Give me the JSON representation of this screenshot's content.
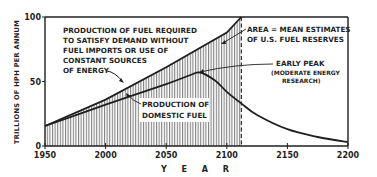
{
  "chart_data": {
    "type": "line",
    "title": "",
    "xlabel": "Y E A R",
    "ylabel": "TRILLIONS OF HPH PER ANNUM",
    "xlim": [
      1950,
      2200
    ],
    "ylim": [
      0,
      100
    ],
    "x_ticks": [
      1950,
      2000,
      2050,
      2100,
      2150,
      2200
    ],
    "y_ticks": [
      0,
      50,
      100
    ],
    "grid": false,
    "legend": "none (inline annotations)",
    "series": [
      {
        "name": "Production of fuel required to satisfy demand without fuel imports or use of constant sources of energy",
        "x": [
          1950,
          2000,
          2050,
          2100,
          2112
        ],
        "y": [
          15.5,
          36,
          61,
          88,
          100
        ]
      },
      {
        "name": "Production of domestic fuel (Early peak, moderate energy research)",
        "x": [
          1950,
          2000,
          2050,
          2070,
          2078,
          2090,
          2100,
          2112,
          2125,
          2150,
          2175,
          2200
        ],
        "y": [
          15.5,
          32,
          48,
          55,
          57,
          51,
          42,
          33,
          24,
          13,
          7,
          3
        ]
      }
    ],
    "shaded_area": {
      "description": "Area = mean estimates of U.S. fuel reserves",
      "x_range": [
        1950,
        2112
      ],
      "pattern": "vertical hatching"
    },
    "reference_lines": [
      {
        "type": "vertical-dashed",
        "x": 2112
      }
    ],
    "annotations": [
      "PRODUCTION OF FUEL REQUIRED",
      "TO SATISFY DEMAND WITHOUT",
      "FUEL IMPORTS OR USE OF",
      "CONSTANT SOURCES",
      "OF ENERGY",
      "AREA = MEAN ESTIMATES",
      "OF U.S. FUEL RESERVES",
      "EARLY PEAK",
      "(MODERATE ENERGY",
      "RESEARCH)",
      "PRODUCTION OF",
      "DOMESTIC FUEL"
    ]
  },
  "labels": {
    "ylabel": "TRILLIONS OF HPH PER ANNUM",
    "xlabel": "Y E A R",
    "yticks": [
      "100",
      "50",
      "0"
    ],
    "xticks": [
      "1950",
      "2000",
      "2050",
      "2100",
      "2150",
      "2200"
    ],
    "demand_note": [
      "PRODUCTION OF  FUEL REQUIRED",
      "TO SATISFY  DEMAND WITHOUT",
      "FUEL IMPORTS  OR USE OF",
      "CONSTANT SOURCES",
      "OF ENERGY"
    ],
    "area_note": [
      "AREA = MEAN ESTIMATES",
      "OF U.S. FUEL RESERVES"
    ],
    "peak_note": [
      "EARLY PEAK",
      "(MODERATE ENERGY",
      "RESEARCH)"
    ],
    "domestic_note": [
      "PRODUCTION OF",
      "DOMESTIC FUEL"
    ]
  },
  "colors": {
    "ink": "#1f1f1f",
    "hatch": "#3a3a3a",
    "background": "#ffffff"
  }
}
